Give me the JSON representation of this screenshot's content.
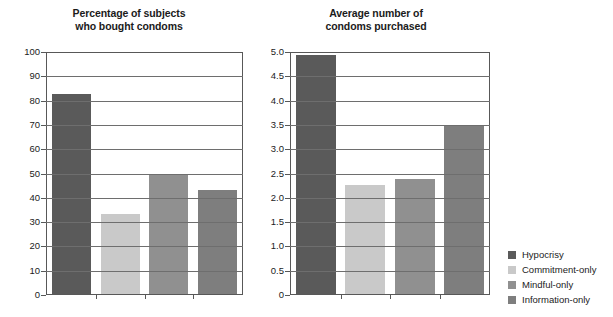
{
  "legend": {
    "position": "right",
    "entries": [
      {
        "label": "Hypocrisy",
        "color": "#5a5a5a"
      },
      {
        "label": "Commitment-only",
        "color": "#c9c9c9"
      },
      {
        "label": "Mindful-only",
        "color": "#909090"
      },
      {
        "label": "Information-only",
        "color": "#7e7e7e"
      }
    ]
  },
  "chart_data": [
    {
      "type": "bar",
      "title": "Percentage of subjects\nwho bought condoms",
      "xlabel": "",
      "ylabel": "",
      "ylim": [
        0,
        100
      ],
      "ytick_step": 10,
      "grid": true,
      "categories": [
        "Hypocrisy",
        "Commitment-only",
        "Mindful-only",
        "Information-only"
      ],
      "values": [
        83,
        33,
        50,
        43
      ],
      "colors": [
        "#5a5a5a",
        "#c9c9c9",
        "#909090",
        "#7e7e7e"
      ],
      "ticks": [
        "0",
        "10",
        "20",
        "30",
        "40",
        "50",
        "60",
        "70",
        "80",
        "90",
        "100"
      ]
    },
    {
      "type": "bar",
      "title": "Average number of\ncondoms purchased",
      "xlabel": "",
      "ylabel": "",
      "ylim": [
        0,
        5.0
      ],
      "ytick_step": 0.5,
      "grid": true,
      "categories": [
        "Hypocrisy",
        "Commitment-only",
        "Mindful-only",
        "Information-only"
      ],
      "values": [
        4.95,
        2.27,
        2.38,
        3.48
      ],
      "colors": [
        "#5a5a5a",
        "#c9c9c9",
        "#909090",
        "#7e7e7e"
      ],
      "ticks": [
        "0",
        "0.5",
        "1.0",
        "1.5",
        "2.0",
        "2.5",
        "3.0",
        "3.5",
        "4.0",
        "4.5",
        "5.0"
      ]
    }
  ]
}
